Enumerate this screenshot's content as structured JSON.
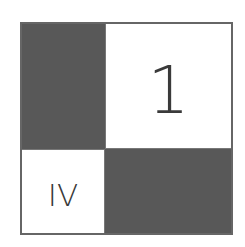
{
  "diagram": {
    "type": "2x2 partitioned square",
    "colors": {
      "dark": "#585858",
      "light": "#ffffff",
      "border": "#666666",
      "text": "#3a3a3a"
    },
    "cells": [
      {
        "position": "top-left",
        "fill": "dark",
        "label": ""
      },
      {
        "position": "top-right",
        "fill": "light",
        "label": "1"
      },
      {
        "position": "bottom-left",
        "fill": "light",
        "label": "IV"
      },
      {
        "position": "bottom-right",
        "fill": "dark",
        "label": ""
      }
    ]
  }
}
